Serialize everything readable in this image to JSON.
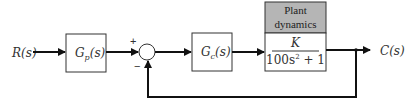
{
  "diagram": {
    "type": "block-diagram",
    "input": {
      "label": "R(s)"
    },
    "output": {
      "label": "C(s)"
    },
    "blocks": [
      {
        "id": "prefilter",
        "label_main": "G",
        "label_sub": "p",
        "label_arg": "(s)"
      },
      {
        "id": "controller",
        "label_main": "G",
        "label_sub": "c",
        "label_arg": "(s)"
      },
      {
        "id": "plant",
        "header_line1": "Plant",
        "header_line2": "dynamics",
        "numerator": "K",
        "denominator_base": "100s",
        "denominator_exp": "2",
        "denominator_tail": " + 1"
      }
    ],
    "summing_junction": {
      "plus": "+",
      "minus": "−"
    },
    "colors": {
      "line": "#111111",
      "plant_header": "#b5b5b5",
      "box_fill": "#ffffff"
    }
  }
}
